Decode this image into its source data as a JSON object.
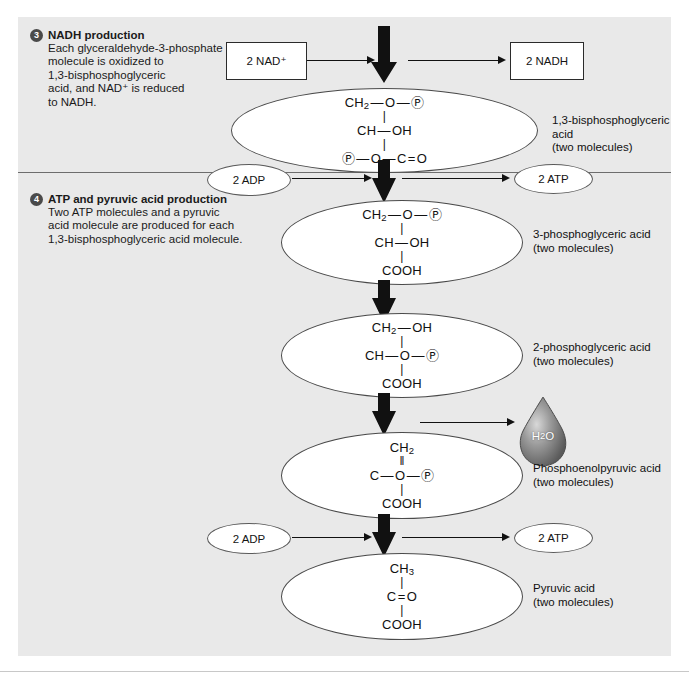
{
  "figure": {
    "background_color": "#e9e9e9",
    "accent_color": "#4a4a4a"
  },
  "steps": [
    {
      "number": "3",
      "title": "NADH production",
      "lines": [
        "Each glyceraldehyde-3-phosphate",
        "molecule is oxidized to",
        "1,3-bisphosphoglyceric",
        "acid, and NAD⁺ is reduced",
        "to NADH."
      ]
    },
    {
      "number": "4",
      "title": "ATP and pyruvic acid production",
      "lines": [
        "Two ATP molecules and a pyruvic",
        "acid molecule are produced for each",
        "1,3-bisphosphoglyceric acid molecule."
      ]
    }
  ],
  "reactants": {
    "nad": "2 NAD⁺",
    "nadh": "2 NADH",
    "adp_1": "2 ADP",
    "atp_1": "2 ATP",
    "adp_2": "2 ADP",
    "atp_2": "2 ATP",
    "water": "H₂O"
  },
  "molecules": [
    {
      "id": "bpg",
      "structure": [
        "CH₂ — O — Ⓟ",
        "|",
        "CH — OH",
        "|",
        "Ⓟ — O — C = O"
      ],
      "rows": [
        {
          "text": "CH2 — O — (P)",
          "type": "atom"
        },
        {
          "text": "|",
          "type": "bond"
        },
        {
          "text": "CH — OH",
          "type": "atom"
        },
        {
          "text": "|",
          "type": "bond"
        },
        {
          "text": "(P) — O — C = O",
          "type": "atom"
        }
      ],
      "caption_name": "1,3-bisphosphoglyceric acid",
      "caption_count": "(two molecules)"
    },
    {
      "id": "3pg",
      "rows": [
        {
          "text": "CH2 — O — (P)",
          "type": "atom"
        },
        {
          "text": "|",
          "type": "bond"
        },
        {
          "text": "CH — OH",
          "type": "atom"
        },
        {
          "text": "|",
          "type": "bond"
        },
        {
          "text": "COOH",
          "type": "atom"
        }
      ],
      "caption_name": "3-phosphoglyceric acid",
      "caption_count": "(two molecules)"
    },
    {
      "id": "2pg",
      "rows": [
        {
          "text": "CH2 — OH",
          "type": "atom"
        },
        {
          "text": "|",
          "type": "bond"
        },
        {
          "text": "CH — O — (P)",
          "type": "atom"
        },
        {
          "text": "|",
          "type": "bond"
        },
        {
          "text": "COOH",
          "type": "atom"
        }
      ],
      "caption_name": "2-phosphoglyceric acid",
      "caption_count": "(two molecules)"
    },
    {
      "id": "pep",
      "rows": [
        {
          "text": "CH2",
          "type": "atom"
        },
        {
          "text": "||",
          "type": "bond"
        },
        {
          "text": "C — O — (P)",
          "type": "atom"
        },
        {
          "text": "|",
          "type": "bond"
        },
        {
          "text": "COOH",
          "type": "atom"
        }
      ],
      "caption_name": "Phosphoenolpyruvic acid",
      "caption_count": "(two molecules)"
    },
    {
      "id": "pyruvate",
      "rows": [
        {
          "text": "CH3",
          "type": "atom"
        },
        {
          "text": "|",
          "type": "bond"
        },
        {
          "text": "C = O",
          "type": "atom"
        },
        {
          "text": "|",
          "type": "bond"
        },
        {
          "text": "COOH",
          "type": "atom"
        }
      ],
      "caption_name": "Pyruvic acid",
      "caption_count": "(two molecules)"
    }
  ]
}
